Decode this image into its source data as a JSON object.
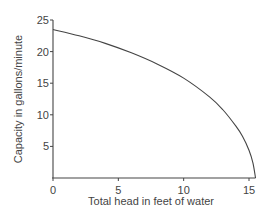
{
  "chart_data": {
    "type": "line",
    "title": "",
    "xlabel": "Total head in feet of water",
    "ylabel": "Capacity in gallons/minute",
    "xlim": [
      0,
      15.5
    ],
    "ylim": [
      0,
      25
    ],
    "xticks": [
      0,
      5,
      10,
      15
    ],
    "yticks": [
      5,
      10,
      15,
      20,
      25
    ],
    "grid": false,
    "series": [
      {
        "name": "Pump capacity",
        "x": [
          0,
          2,
          4,
          6,
          8,
          10,
          12,
          13,
          14,
          14.5,
          15,
          15.3,
          15.5
        ],
        "y": [
          23.5,
          22.5,
          21.3,
          19.8,
          18.0,
          15.8,
          12.8,
          10.8,
          8.2,
          6.6,
          4.4,
          2.4,
          0
        ]
      }
    ]
  }
}
